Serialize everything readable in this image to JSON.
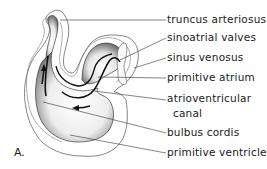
{
  "figure": {
    "panel_letter": "A.",
    "labels": [
      {
        "id": "truncus-arteriosus",
        "text": "truncus arteriosus",
        "x": 167,
        "y": 11
      },
      {
        "id": "sinoatrial-valves",
        "text": "sinoatrial valves",
        "x": 167,
        "y": 31
      },
      {
        "id": "sinus-venosus",
        "text": "sinus venosus",
        "x": 167,
        "y": 51
      },
      {
        "id": "primitive-atrium",
        "text": "primitive atrium",
        "x": 167,
        "y": 71
      },
      {
        "id": "atrioventricular-canal-line1",
        "text": "atrioventricular",
        "x": 167,
        "y": 92
      },
      {
        "id": "atrioventricular-canal-line2",
        "text": "canal",
        "x": 173,
        "y": 107
      },
      {
        "id": "bulbus-cordis",
        "text": "bulbus cordis",
        "x": 167,
        "y": 126
      },
      {
        "id": "primitive-ventricle",
        "text": "primitive ventricle",
        "x": 167,
        "y": 146
      }
    ],
    "colors": {
      "ink": "#1a1a1a",
      "outline": "#555555",
      "shade": "#3a3a3a",
      "background": "#ffffff"
    }
  }
}
